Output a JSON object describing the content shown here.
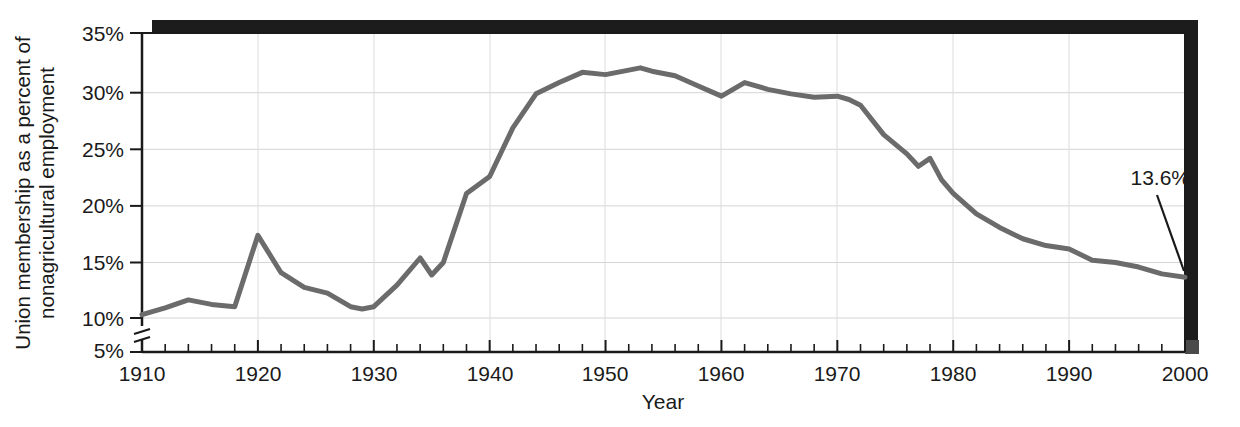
{
  "chart_data": {
    "type": "line",
    "title": "",
    "xlabel": "Year",
    "ylabel_line1": "Union membership as a percent of",
    "ylabel_line2": "nonagricultural employment",
    "xlim": [
      1910,
      2000
    ],
    "ylim": [
      5,
      35
    ],
    "y_axis_break": true,
    "y_break_between": [
      5,
      10
    ],
    "grid": true,
    "legend": null,
    "xticks": [
      1910,
      1920,
      1930,
      1940,
      1950,
      1960,
      1970,
      1980,
      1990,
      2000
    ],
    "xtick_labels": [
      "1910",
      "1920",
      "1930",
      "1940",
      "1950",
      "1960",
      "1970",
      "1980",
      "1990",
      "2000"
    ],
    "x_minor_tick_interval": 2,
    "yticks": [
      5,
      10,
      15,
      20,
      25,
      30,
      35
    ],
    "ytick_labels": [
      "5%",
      "10%",
      "15%",
      "20%",
      "25%",
      "30%",
      "35%"
    ],
    "line_color": "#6b6b6b",
    "line_width": 5,
    "annotations": [
      {
        "text": "13.6%",
        "x": 2000,
        "y": 13.6,
        "label_x": 1190,
        "label_y": 185,
        "arrow_from_x": 1157,
        "arrow_from_y": 195,
        "arrow_to_x": 1184,
        "arrow_to_y": 271
      }
    ],
    "x": [
      1910,
      1912,
      1914,
      1916,
      1918,
      1920,
      1922,
      1924,
      1926,
      1928,
      1929,
      1930,
      1932,
      1934,
      1935,
      1936,
      1938,
      1940,
      1942,
      1944,
      1946,
      1948,
      1950,
      1952,
      1953,
      1954,
      1956,
      1958,
      1960,
      1962,
      1964,
      1966,
      1968,
      1970,
      1971,
      1972,
      1974,
      1976,
      1977,
      1978,
      1979,
      1980,
      1982,
      1984,
      1986,
      1988,
      1990,
      1992,
      1994,
      1996,
      1998,
      2000
    ],
    "values": [
      10.3,
      10.9,
      11.6,
      11.2,
      11.0,
      17.3,
      14.0,
      12.7,
      12.2,
      11.0,
      10.8,
      11.0,
      12.9,
      15.3,
      13.8,
      14.9,
      21.0,
      22.5,
      26.8,
      29.8,
      30.8,
      31.7,
      31.5,
      31.9,
      32.1,
      31.8,
      31.4,
      30.5,
      29.6,
      30.8,
      30.2,
      29.8,
      29.5,
      29.6,
      29.3,
      28.8,
      26.2,
      24.5,
      23.4,
      24.1,
      22.2,
      21.0,
      19.2,
      18.0,
      17.0,
      16.4,
      16.1,
      15.1,
      14.9,
      14.5,
      13.9,
      13.6
    ]
  },
  "plot_geometry": {
    "left": 142,
    "right": 1185,
    "top": 33,
    "bottom": 352,
    "y_top_value": 35,
    "y_bottom_value": 10,
    "y_pixel_at_10": 318,
    "y_pixel_per_5pct": 56.6
  }
}
